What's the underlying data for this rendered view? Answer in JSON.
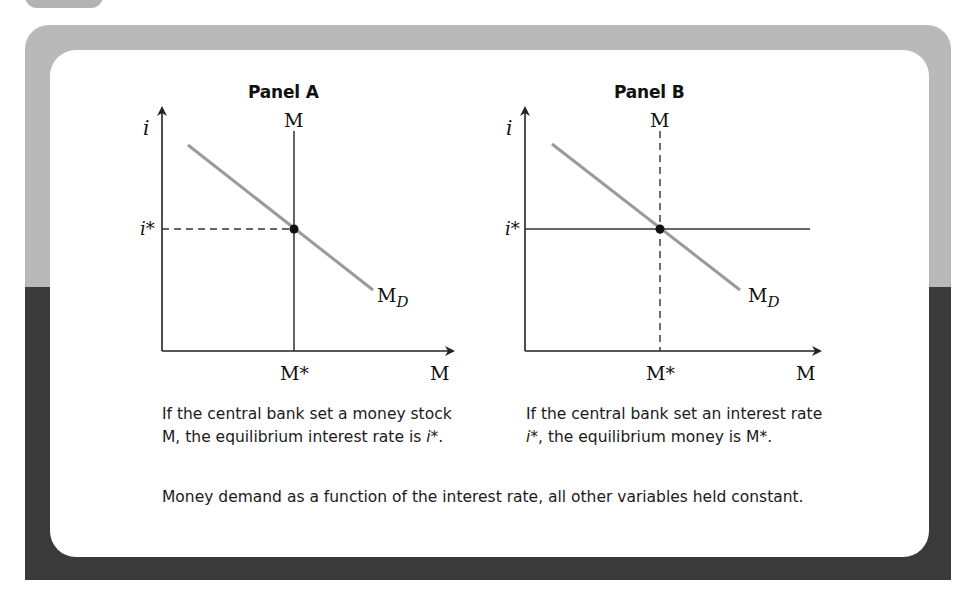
{
  "figure": {
    "panels": [
      {
        "title": "Panel A",
        "y_axis_label": "i",
        "x_axis_label": "M",
        "supply_label": "M",
        "supply_style": "solid vertical",
        "rate_label": "i*",
        "rate_style": "dashed horizontal",
        "equilibrium_quantity_label": "M*",
        "demand_label": "M",
        "demand_subscript": "D",
        "caption_parts": [
          "If the central bank set a money stock M, the equilibrium interest rate is ",
          "i",
          "*."
        ]
      },
      {
        "title": "Panel B",
        "y_axis_label": "i",
        "x_axis_label": "M",
        "supply_label": "M",
        "supply_style": "dashed vertical",
        "rate_label": "i*",
        "rate_style": "solid horizontal",
        "equilibrium_quantity_label": "M*",
        "demand_label": "M",
        "demand_subscript": "D",
        "caption_parts": [
          "If the central bank set an interest rate ",
          "i",
          "*, the equilibrium money is M*."
        ]
      }
    ],
    "footer_caption": "Money demand as a function of the interest rate, all other variables held constant."
  },
  "colors": {
    "frame_top": "#b9b9b9",
    "frame_bottom": "#3a3a3a",
    "demand_line": "#9a9a9a",
    "axis": "#222222"
  }
}
